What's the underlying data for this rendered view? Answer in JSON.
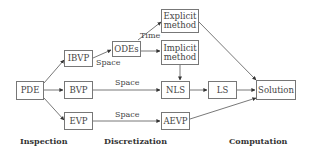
{
  "nodes": {
    "pde": "PDE",
    "ibvp": "IBVP",
    "bvp": "BVP",
    "evp": "EVP",
    "odes": "ODEs",
    "explicit": "Explicit method",
    "implicit": "Implicit method",
    "nls": "NLS",
    "ls": "LS",
    "aevp": "AEVP",
    "solution": "Solution"
  },
  "edge_labels": {
    "ibvp_odes": "Space",
    "odes_explicit": "Time",
    "bvp_nls": "Space",
    "evp_aevp": "Space"
  },
  "stages": {
    "inspection": "Inspection",
    "discretization": "Discretization",
    "computation": "Computation"
  },
  "edges": [
    [
      "PDE",
      "IBVP"
    ],
    [
      "PDE",
      "BVP"
    ],
    [
      "PDE",
      "EVP"
    ],
    [
      "IBVP",
      "ODEs"
    ],
    [
      "ODEs",
      "Explicit method"
    ],
    [
      "ODEs",
      "Implicit method"
    ],
    [
      "BVP",
      "NLS"
    ],
    [
      "EVP",
      "AEVP"
    ],
    [
      "Implicit method",
      "NLS"
    ],
    [
      "NLS",
      "LS"
    ],
    [
      "LS",
      "Solution"
    ],
    [
      "Explicit method",
      "Solution"
    ],
    [
      "AEVP",
      "Solution"
    ]
  ]
}
